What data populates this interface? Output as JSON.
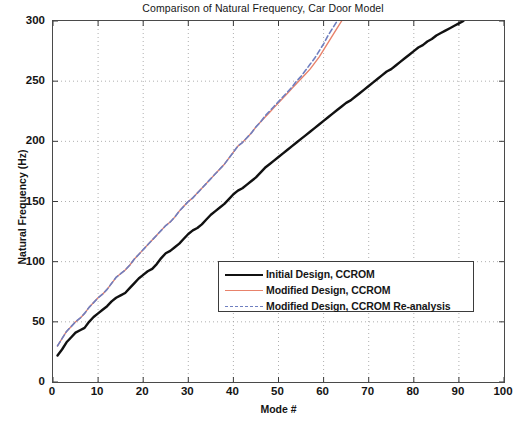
{
  "chart_data": {
    "type": "line",
    "title": "Comparison of Natural Frequency, Car Door Model",
    "xlabel": "Mode #",
    "ylabel": "Natural Frequency (Hz)",
    "xlim": [
      0,
      100
    ],
    "ylim": [
      0,
      300
    ],
    "xticks": [
      0,
      10,
      20,
      30,
      40,
      50,
      60,
      70,
      80,
      90,
      100
    ],
    "yticks": [
      0,
      50,
      100,
      150,
      200,
      250,
      300
    ],
    "grid": "dotted",
    "legend_position": "center",
    "series": [
      {
        "name": "Initial Design, CCROM",
        "color": "#111111",
        "style": "solid",
        "width": 2.4,
        "x": [
          1,
          2,
          3,
          4,
          5,
          6,
          7,
          8,
          9,
          10,
          11,
          12,
          13,
          14,
          15,
          16,
          17,
          18,
          19,
          20,
          21,
          22,
          23,
          24,
          25,
          26,
          27,
          28,
          29,
          30,
          31,
          32,
          33,
          34,
          35,
          36,
          37,
          38,
          39,
          40,
          41,
          42,
          43,
          44,
          45,
          46,
          47,
          48,
          49,
          50,
          51,
          52,
          53,
          54,
          55,
          56,
          57,
          58,
          59,
          60,
          61,
          62,
          63,
          64,
          65,
          66,
          67,
          68,
          69,
          70,
          71,
          72,
          73,
          74,
          75,
          76,
          77,
          78,
          79,
          80,
          81,
          82,
          83,
          84,
          85,
          86,
          87,
          88,
          89,
          90,
          91
        ],
        "y": [
          22,
          27,
          33,
          37,
          41,
          43,
          45,
          50,
          54,
          57,
          60,
          63,
          67,
          70,
          72,
          74,
          78,
          82,
          86,
          89,
          92,
          94,
          98,
          103,
          107,
          109,
          112,
          115,
          119,
          123,
          126,
          128,
          131,
          135,
          139,
          142,
          145,
          148,
          152,
          156,
          159,
          161,
          164,
          167,
          170,
          174,
          178,
          181,
          184,
          187,
          190,
          193,
          196,
          199,
          202,
          205,
          208,
          211,
          214,
          217,
          220,
          223,
          226,
          229,
          232,
          234,
          237,
          240,
          243,
          246,
          249,
          252,
          255,
          258,
          260,
          263,
          266,
          269,
          272,
          275,
          278,
          280,
          283,
          285,
          288,
          290,
          292,
          294,
          296,
          298,
          300
        ]
      },
      {
        "name": "Modified Design, CCROM",
        "color": "#e8826b",
        "style": "solid",
        "width": 1.4,
        "x": [
          1,
          2,
          3,
          4,
          5,
          6,
          7,
          8,
          9,
          10,
          11,
          12,
          13,
          14,
          15,
          16,
          17,
          18,
          19,
          20,
          21,
          22,
          23,
          24,
          25,
          26,
          27,
          28,
          29,
          30,
          31,
          32,
          33,
          34,
          35,
          36,
          37,
          38,
          39,
          40,
          41,
          42,
          43,
          44,
          45,
          46,
          47,
          48,
          49,
          50,
          51,
          52,
          53,
          54,
          55,
          56,
          57,
          58,
          59,
          60,
          61,
          62,
          63,
          64
        ],
        "y": [
          30,
          36,
          42,
          46,
          50,
          53,
          57,
          62,
          66,
          70,
          73,
          77,
          82,
          87,
          90,
          93,
          97,
          102,
          106,
          110,
          114,
          118,
          122,
          126,
          130,
          133,
          137,
          142,
          146,
          150,
          153,
          157,
          161,
          165,
          169,
          173,
          177,
          181,
          186,
          191,
          196,
          199,
          203,
          207,
          212,
          216,
          220,
          224,
          228,
          232,
          236,
          240,
          244,
          248,
          252,
          256,
          260,
          265,
          270,
          276,
          282,
          288,
          294,
          300
        ]
      },
      {
        "name": "Modified Design, CCROM Re-analysis",
        "color": "#6f7fc0",
        "style": "dashed",
        "width": 1.6,
        "x": [
          1,
          2,
          3,
          4,
          5,
          6,
          7,
          8,
          9,
          10,
          11,
          12,
          13,
          14,
          15,
          16,
          17,
          18,
          19,
          20,
          21,
          22,
          23,
          24,
          25,
          26,
          27,
          28,
          29,
          30,
          31,
          32,
          33,
          34,
          35,
          36,
          37,
          38,
          39,
          40,
          41,
          42,
          43,
          44,
          45,
          46,
          47,
          48,
          49,
          50,
          51,
          52,
          53,
          54,
          55,
          56,
          57,
          58,
          59,
          60,
          61,
          62,
          63
        ],
        "y": [
          30,
          36,
          42,
          46,
          50,
          53,
          57,
          62,
          66,
          70,
          73,
          77,
          82,
          87,
          90,
          93,
          97,
          102,
          106,
          110,
          114,
          118,
          122,
          126,
          130,
          133,
          137,
          142,
          146,
          150,
          153,
          157,
          161,
          165,
          169,
          173,
          177,
          181,
          186,
          191,
          196,
          199,
          203,
          207,
          212,
          216,
          221,
          225,
          229,
          233,
          237,
          241,
          245,
          250,
          254,
          259,
          264,
          269,
          275,
          281,
          288,
          294,
          300
        ]
      }
    ]
  },
  "axis": {
    "x_tick_labels": [
      "0",
      "10",
      "20",
      "30",
      "40",
      "50",
      "60",
      "70",
      "80",
      "90",
      "100"
    ],
    "y_tick_labels": [
      "0",
      "50",
      "100",
      "150",
      "200",
      "250",
      "300"
    ]
  },
  "legend": {
    "items": [
      {
        "label": "Initial Design, CCROM"
      },
      {
        "label": "Modified Design, CCROM"
      },
      {
        "label": "Modified Design, CCROM Re-analysis"
      }
    ]
  }
}
